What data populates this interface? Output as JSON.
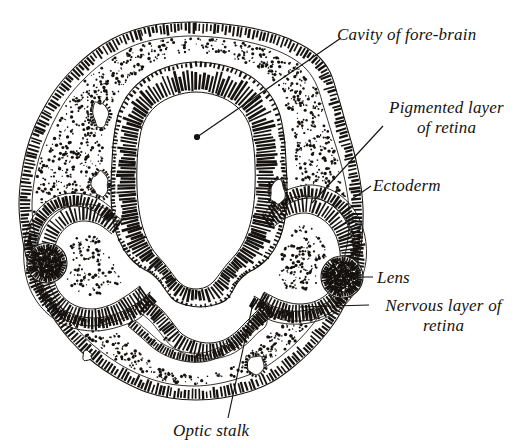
{
  "figure": {
    "background_color": "#ffffff",
    "ink_color": "#15120f",
    "width": 518,
    "height": 447
  },
  "labels": {
    "cavity_of_forebrain": "Cavity of fore-brain",
    "pigmented_layer_line1": "Pigmented layer",
    "pigmented_layer_line2": "of retina",
    "ectoderm": "Ectoderm",
    "lens": "Lens",
    "nervous_layer_line1": "Nervous layer of",
    "nervous_layer_line2": "retina",
    "optic_stalk": "Optic stalk"
  },
  "leaders": [
    {
      "name": "leader-cavity-of-forebrain",
      "x1": 341,
      "y1": 38,
      "x2": 197,
      "y2": 137,
      "dot": true
    },
    {
      "name": "leader-pigmented-layer",
      "x1": 383,
      "y1": 126,
      "x2": 312,
      "y2": 203,
      "dot": false
    },
    {
      "name": "leader-ectoderm",
      "x1": 371,
      "y1": 186,
      "x2": 352,
      "y2": 199,
      "dot": false
    },
    {
      "name": "leader-lens",
      "x1": 373,
      "y1": 277,
      "x2": 339,
      "y2": 277,
      "dot": false
    },
    {
      "name": "leader-nervous-layer",
      "x1": 369,
      "y1": 305,
      "x2": 299,
      "y2": 307,
      "dot": false
    },
    {
      "name": "leader-optic-stalk",
      "x1": 253,
      "y1": 303,
      "x2": 228,
      "y2": 418,
      "dot": false
    }
  ],
  "structures": [
    {
      "name": "surface-ectoderm",
      "描": "outer hatched epithelial band"
    },
    {
      "name": "mesenchyme",
      "描": "stippled loose tissue"
    },
    {
      "name": "forebrain-wall",
      "描": "palisaded neuroepithelium"
    },
    {
      "name": "forebrain-cavity",
      "描": "central white lumen"
    },
    {
      "name": "optic-cup-left",
      "描": "left optic cup with two retinal layers"
    },
    {
      "name": "optic-cup-right",
      "描": "right optic cup with two retinal layers"
    },
    {
      "name": "lens-vesicle-left",
      "描": "left lens"
    },
    {
      "name": "lens-vesicle-right",
      "描": "right lens"
    },
    {
      "name": "optic-stalk",
      "描": "ventral stalk connecting cup to brain"
    }
  ]
}
